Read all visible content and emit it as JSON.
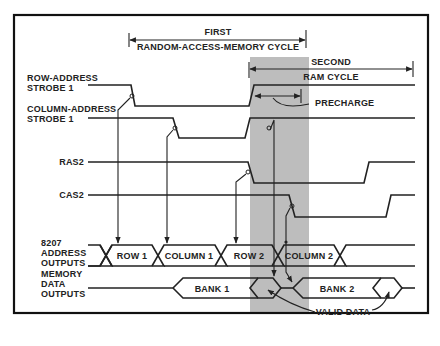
{
  "diagram": {
    "title_first": "FIRST",
    "title_first_sub": "RANDOM-ACCESS-MEMORY CYCLE",
    "title_second": "SECOND",
    "title_second_sub": "RAM CYCLE",
    "precharge_label": "PRECHARGE",
    "valid_data_label": "VALID DATA",
    "shade_color": "#bdbdbd",
    "line_color": "#222222",
    "signals": [
      {
        "label_lines": [
          "ROW-ADDRESS",
          "STROBE 1"
        ]
      },
      {
        "label_lines": [
          "COLUMN-ADDRESS",
          "STROBE 1"
        ]
      },
      {
        "label_lines": [
          "RAS2"
        ]
      },
      {
        "label_lines": [
          "CAS2"
        ]
      },
      {
        "label_lines": [
          "8207",
          "ADDRESS",
          "OUTPUTS"
        ]
      },
      {
        "label_lines": [
          "MEMORY",
          "DATA",
          "OUTPUTS"
        ]
      }
    ],
    "address_segments": [
      "ROW 1",
      "COLUMN 1",
      "ROW 2",
      "COLUMN 2"
    ],
    "data_segments": [
      "BANK 1",
      "BANK 2"
    ]
  }
}
